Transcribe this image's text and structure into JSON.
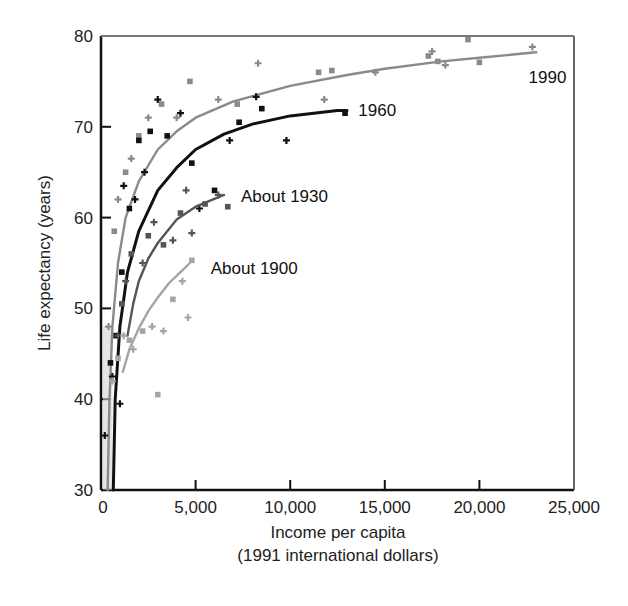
{
  "chart_data": {
    "type": "scatter",
    "title": "",
    "xlabel": "Income per capita",
    "xlabel_sub": "(1991 international dollars)",
    "ylabel": "Life expectancy (years)",
    "xlim": [
      0,
      25000
    ],
    "ylim": [
      30,
      80
    ],
    "xticks": [
      0,
      5000,
      10000,
      15000,
      20000,
      25000
    ],
    "xtick_labels": [
      "0",
      "5,000",
      "10,000",
      "15,000",
      "20,000",
      "25,000"
    ],
    "yticks": [
      30,
      40,
      50,
      60,
      70,
      80
    ],
    "ytick_labels": [
      "30",
      "40",
      "50",
      "60",
      "70",
      "80"
    ],
    "grid": false,
    "legend": "inline-labels",
    "series": [
      {
        "name": "1990",
        "label": "1990",
        "color": "#8a8a8a",
        "curve": [
          [
            350,
            30
          ],
          [
            450,
            40
          ],
          [
            600,
            48
          ],
          [
            900,
            55
          ],
          [
            1300,
            60
          ],
          [
            2000,
            64
          ],
          [
            3000,
            67.5
          ],
          [
            4000,
            69.5
          ],
          [
            5000,
            71
          ],
          [
            7000,
            72.8
          ],
          [
            10000,
            74.5
          ],
          [
            13000,
            75.7
          ],
          [
            15000,
            76.4
          ],
          [
            18000,
            77.2
          ],
          [
            20000,
            77.6
          ],
          [
            23000,
            78.2
          ]
        ],
        "points": [
          [
            400,
            48
          ],
          [
            700,
            58.5
          ],
          [
            900,
            62
          ],
          [
            1300,
            65
          ],
          [
            1600,
            66.5
          ],
          [
            2000,
            69
          ],
          [
            2500,
            71
          ],
          [
            3200,
            72.5
          ],
          [
            4000,
            71
          ],
          [
            4700,
            75
          ],
          [
            6200,
            73
          ],
          [
            7200,
            72.5
          ],
          [
            8300,
            77
          ],
          [
            11500,
            76
          ],
          [
            11800,
            73
          ],
          [
            12200,
            76.2
          ],
          [
            14500,
            76
          ],
          [
            17300,
            77.8
          ],
          [
            17500,
            78.3
          ],
          [
            17800,
            77.2
          ],
          [
            18200,
            76.8
          ],
          [
            20000,
            77.1
          ],
          [
            22800,
            78.8
          ],
          [
            19400,
            79.6
          ]
        ]
      },
      {
        "name": "1960",
        "label": "1960",
        "color": "#111111",
        "curve": [
          [
            650,
            30
          ],
          [
            750,
            40
          ],
          [
            1000,
            48
          ],
          [
            1400,
            54
          ],
          [
            2000,
            58.5
          ],
          [
            3000,
            63
          ],
          [
            4000,
            65.5
          ],
          [
            5000,
            67.5
          ],
          [
            6500,
            69.2
          ],
          [
            8000,
            70.3
          ],
          [
            10000,
            71.2
          ],
          [
            12500,
            71.8
          ],
          [
            13000,
            71.8
          ]
        ],
        "points": [
          [
            200,
            36
          ],
          [
            500,
            44
          ],
          [
            600,
            42.5
          ],
          [
            800,
            47
          ],
          [
            1000,
            39.5
          ],
          [
            1100,
            54
          ],
          [
            1200,
            63.5
          ],
          [
            1500,
            61
          ],
          [
            1800,
            62
          ],
          [
            2000,
            68.5
          ],
          [
            2300,
            65
          ],
          [
            2600,
            69.5
          ],
          [
            3000,
            73
          ],
          [
            3500,
            69
          ],
          [
            4200,
            71.5
          ],
          [
            4800,
            66
          ],
          [
            5200,
            61
          ],
          [
            6000,
            63
          ],
          [
            6800,
            68.5
          ],
          [
            7300,
            70.5
          ],
          [
            8200,
            73.3
          ],
          [
            8500,
            72
          ],
          [
            9800,
            68.5
          ],
          [
            12900,
            71.5
          ]
        ]
      },
      {
        "name": "About 1930",
        "label": "About 1930",
        "color": "#555555",
        "curve": [
          [
            1400,
            47
          ],
          [
            1700,
            50.5
          ],
          [
            2000,
            53
          ],
          [
            2500,
            55.5
          ],
          [
            3000,
            57.2
          ],
          [
            3500,
            58.5
          ],
          [
            4000,
            59.8
          ],
          [
            5000,
            61.2
          ],
          [
            6500,
            62.5
          ]
        ],
        "points": [
          [
            900,
            47
          ],
          [
            1100,
            50.5
          ],
          [
            1300,
            53
          ],
          [
            1600,
            56
          ],
          [
            2200,
            55
          ],
          [
            2500,
            58
          ],
          [
            2800,
            59.5
          ],
          [
            3300,
            57
          ],
          [
            3800,
            57.5
          ],
          [
            4200,
            60.5
          ],
          [
            4800,
            58.3
          ],
          [
            5500,
            61.5
          ],
          [
            6200,
            62.5
          ],
          [
            6700,
            61.2
          ],
          [
            4500,
            63
          ]
        ]
      },
      {
        "name": "About 1900",
        "label": "About 1900",
        "color": "#a5a5a5",
        "curve": [
          [
            1150,
            43
          ],
          [
            1500,
            45.5
          ],
          [
            2000,
            47.8
          ],
          [
            2500,
            49.7
          ],
          [
            3000,
            51.2
          ],
          [
            3600,
            52.8
          ],
          [
            4200,
            54
          ],
          [
            4700,
            55
          ]
        ],
        "points": [
          [
            600,
            42
          ],
          [
            900,
            44.5
          ],
          [
            1200,
            47
          ],
          [
            1500,
            46.5
          ],
          [
            1700,
            45.5
          ],
          [
            2200,
            47.5
          ],
          [
            2700,
            48
          ],
          [
            3000,
            40.5
          ],
          [
            3300,
            47.5
          ],
          [
            3800,
            51
          ],
          [
            4600,
            49
          ],
          [
            4800,
            55.3
          ],
          [
            4300,
            53
          ]
        ]
      }
    ],
    "annotations": [
      {
        "text": "1990",
        "x": 22600,
        "y": 75.5
      },
      {
        "text": "1960",
        "x": 13600,
        "y": 71.8
      },
      {
        "text": "About 1930",
        "x": 7400,
        "y": 62.4
      },
      {
        "text": "About 1900",
        "x": 5800,
        "y": 54.5
      }
    ]
  }
}
